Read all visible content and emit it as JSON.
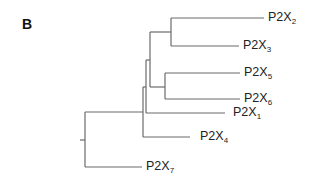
{
  "figure": {
    "panel_label": "B",
    "type": "phylogenetic-tree",
    "topology": "(((((P2X2,P2X3),(P2X5,P2X6)),P2X1),P2X4),P2X7)",
    "line_color": "#6b6b6b",
    "leaves": [
      {
        "id": "p2x2",
        "prefix": "P2X",
        "subscript": "2"
      },
      {
        "id": "p2x3",
        "prefix": "P2X",
        "subscript": "3"
      },
      {
        "id": "p2x5",
        "prefix": "P2X",
        "subscript": "5"
      },
      {
        "id": "p2x6",
        "prefix": "P2X",
        "subscript": "6"
      },
      {
        "id": "p2x1",
        "prefix": "P2X",
        "subscript": "1"
      },
      {
        "id": "p2x4",
        "prefix": "P2X",
        "subscript": "4"
      },
      {
        "id": "p2x7",
        "prefix": "P2X",
        "subscript": "7"
      }
    ]
  }
}
